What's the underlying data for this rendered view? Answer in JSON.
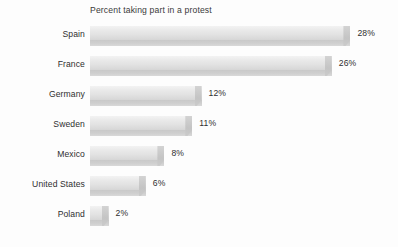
{
  "chart_data": {
    "type": "bar",
    "orientation": "horizontal",
    "title": "Percent taking part in a protest",
    "xlabel": "",
    "ylabel": "",
    "grid": false,
    "legend": false,
    "value_suffix": "%",
    "xlim": [
      0,
      30
    ],
    "categories": [
      "Spain",
      "France",
      "Germany",
      "Sweden",
      "Mexico",
      "United States",
      "Poland"
    ],
    "values": [
      28,
      26,
      12,
      11,
      8,
      6,
      2
    ],
    "value_labels": [
      "28%",
      "26%",
      "12%",
      "11%",
      "8%",
      "6%",
      "2%"
    ],
    "colors": {
      "bar_face_light": "#f3f3f3",
      "bar_face_dark": "#d6d6d6",
      "bar_shade": "#c9c9c9",
      "text": "#2f2f2f",
      "title_text": "#3a3a3a",
      "background": "#fdfdfd"
    },
    "rows": [
      {
        "label": "Spain",
        "value": 28,
        "value_label": "28%"
      },
      {
        "label": "France",
        "value": 26,
        "value_label": "26%"
      },
      {
        "label": "Germany",
        "value": 12,
        "value_label": "12%"
      },
      {
        "label": "Sweden",
        "value": 11,
        "value_label": "11%"
      },
      {
        "label": "Mexico",
        "value": 8,
        "value_label": "8%"
      },
      {
        "label": "United States",
        "value": 6,
        "value_label": "6%"
      },
      {
        "label": "Poland",
        "value": 2,
        "value_label": "2%"
      }
    ]
  }
}
